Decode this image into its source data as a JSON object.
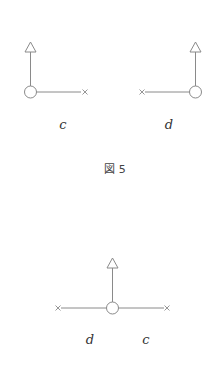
{
  "figure": {
    "caption": "図 5",
    "panels": [
      {
        "id": "c",
        "label": "c",
        "node": "circle",
        "arrow": "up-triangle",
        "branch": "right-x"
      },
      {
        "id": "d",
        "label": "d",
        "node": "circle",
        "arrow": "up-triangle",
        "branch": "left-x"
      },
      {
        "id": "dc",
        "labels": [
          "d",
          "c"
        ],
        "node": "circle",
        "arrow": "up-triangle",
        "branch": "left-x and right-x"
      }
    ]
  },
  "colors": {
    "line": "#8a8a8a",
    "text": "#333333",
    "background": "#ffffff"
  }
}
